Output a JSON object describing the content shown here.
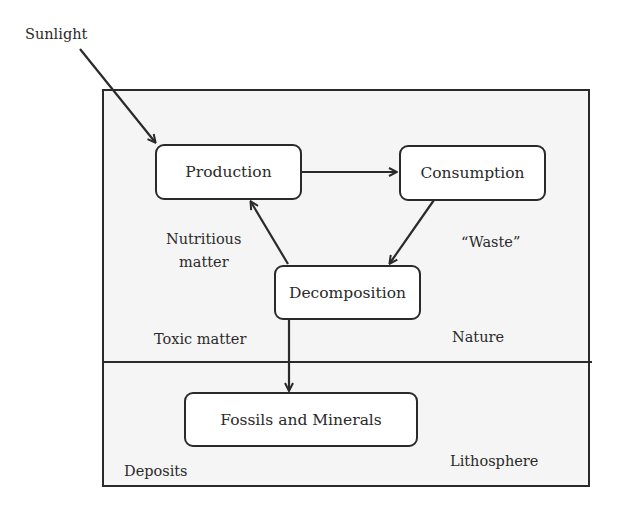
{
  "diagram": {
    "input_label": "Sunlight",
    "nodes": {
      "production": "Production",
      "consumption": "Consumption",
      "decomposition": "Decomposition",
      "fossils": "Fossils and Minerals"
    },
    "labels": {
      "nutritious": "Nutritious",
      "nutritious_2": "matter",
      "waste": "“Waste”",
      "toxic": "Toxic matter",
      "nature": "Nature",
      "deposits": "Deposits",
      "lithosphere": "Lithosphere"
    },
    "regions": [
      "Nature",
      "Lithosphere"
    ],
    "edges": [
      {
        "from": "Sunlight",
        "to": "Production"
      },
      {
        "from": "Production",
        "to": "Consumption"
      },
      {
        "from": "Consumption",
        "to": "Decomposition",
        "label": "“Waste”"
      },
      {
        "from": "Decomposition",
        "to": "Production",
        "label": "Nutritious matter"
      },
      {
        "from": "Decomposition",
        "to": "Fossils and Minerals"
      }
    ]
  }
}
